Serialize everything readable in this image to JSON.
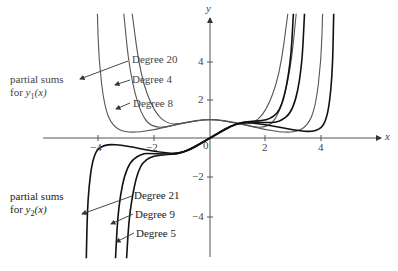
{
  "chart_data": {
    "type": "line",
    "title": "",
    "xlabel": "x",
    "ylabel": "y",
    "xlim": [
      -6,
      6.2
    ],
    "ylim": [
      -6.2,
      6.5
    ],
    "grid": false,
    "x_ticks": [
      -4,
      -2,
      0,
      2,
      4
    ],
    "y_ticks": [
      -4,
      -2,
      2,
      4
    ],
    "x_tick_labels": [
      "-4",
      "-2",
      "0",
      "2",
      "4"
    ],
    "y_tick_labels": [
      "-4",
      "-2",
      "2",
      "4"
    ],
    "groups": [
      {
        "label": "partial sums for y1(x)",
        "series": [
          {
            "name": "Degree 20",
            "color": "#555555",
            "points": [
              [
                -4.05,
                6.4
              ],
              [
                -4.0,
                4.0
              ],
              [
                -3.8,
                1.6
              ],
              [
                -3.5,
                0.6
              ],
              [
                -3.0,
                0.25
              ],
              [
                -2.0,
                0.4
              ],
              [
                -1.0,
                0.8
              ],
              [
                0,
                1.0
              ],
              [
                1.0,
                0.8
              ],
              [
                2.0,
                0.4
              ],
              [
                3.0,
                0.25
              ],
              [
                3.5,
                0.6
              ],
              [
                3.8,
                1.6
              ],
              [
                4.0,
                4.0
              ],
              [
                4.05,
                6.4
              ]
            ]
          },
          {
            "name": "Degree 4",
            "color": "#555555",
            "points": [
              [
                -2.8,
                6.4
              ],
              [
                -2.5,
                3.2
              ],
              [
                -2.0,
                1.3
              ],
              [
                -1.5,
                0.7
              ],
              [
                -1.0,
                0.75
              ],
              [
                0,
                1.0
              ],
              [
                1.0,
                0.75
              ],
              [
                1.5,
                0.7
              ],
              [
                2.0,
                1.3
              ],
              [
                2.5,
                3.2
              ],
              [
                2.8,
                6.4
              ]
            ]
          },
          {
            "name": "Degree 8",
            "color": "#555555",
            "points": [
              [
                -3.1,
                6.4
              ],
              [
                -2.9,
                3.5
              ],
              [
                -2.5,
                1.2
              ],
              [
                -2.0,
                0.45
              ],
              [
                -1.0,
                0.75
              ],
              [
                0,
                1.0
              ],
              [
                1.0,
                0.75
              ],
              [
                2.0,
                0.45
              ],
              [
                2.5,
                1.2
              ],
              [
                2.9,
                3.5
              ],
              [
                3.1,
                6.4
              ]
            ]
          }
        ]
      },
      {
        "label": "partial sums for y2(x)",
        "series": [
          {
            "name": "Degree 21",
            "color": "#111111",
            "points": [
              [
                -4.45,
                -6.2
              ],
              [
                -4.4,
                -3.0
              ],
              [
                -4.2,
                -0.8
              ],
              [
                -3.8,
                -0.3
              ],
              [
                -3.0,
                -0.4
              ],
              [
                -2.0,
                -0.7
              ],
              [
                -1.0,
                -0.85
              ],
              [
                0,
                0
              ],
              [
                1.0,
                0.85
              ],
              [
                2.0,
                0.7
              ],
              [
                3.0,
                0.4
              ],
              [
                3.8,
                0.3
              ],
              [
                4.2,
                0.8
              ],
              [
                4.4,
                3.0
              ],
              [
                4.45,
                6.4
              ]
            ]
          },
          {
            "name": "Degree 9",
            "color": "#111111",
            "points": [
              [
                -3.4,
                -6.2
              ],
              [
                -3.3,
                -3.5
              ],
              [
                -3.0,
                -1.4
              ],
              [
                -2.5,
                -0.8
              ],
              [
                -2.0,
                -0.8
              ],
              [
                -1.0,
                -0.85
              ],
              [
                0,
                0
              ],
              [
                1.0,
                0.85
              ],
              [
                2.0,
                0.8
              ],
              [
                2.5,
                0.8
              ],
              [
                3.0,
                1.4
              ],
              [
                3.3,
                3.5
              ],
              [
                3.4,
                6.4
              ]
            ]
          },
          {
            "name": "Degree 5",
            "color": "#111111",
            "points": [
              [
                -3.0,
                -6.2
              ],
              [
                -2.9,
                -3.8
              ],
              [
                -2.6,
                -1.6
              ],
              [
                -2.2,
                -0.95
              ],
              [
                -1.5,
                -0.85
              ],
              [
                -1.0,
                -0.8
              ],
              [
                0,
                0
              ],
              [
                1.0,
                0.8
              ],
              [
                1.5,
                0.85
              ],
              [
                2.2,
                0.95
              ],
              [
                2.6,
                1.6
              ],
              [
                2.9,
                3.8
              ],
              [
                3.0,
                6.4
              ]
            ]
          }
        ]
      }
    ]
  },
  "labels": {
    "y1_group_line1": "partial sums",
    "y1_group_line2_prefix": "for ",
    "y1_group_fn": "y",
    "y1_group_sub": "1",
    "y1_group_arg": "(x)",
    "y2_group_line1": "partial sums",
    "y2_group_line2_prefix": "for ",
    "y2_group_fn": "y",
    "y2_group_sub": "2",
    "y2_group_arg": "(x)",
    "deg20": "Degree 20",
    "deg4": "Degree 4",
    "deg8": "Degree 8",
    "deg21": "Degree 21",
    "deg9": "Degree 9",
    "deg5": "Degree 5",
    "x_axis": "x",
    "y_axis": "y"
  },
  "ticks": {
    "xm4": "−4",
    "xm2": "−2",
    "x0": "0",
    "x2": "2",
    "x4": "4",
    "y4": "4",
    "y2": "2",
    "ym2": "−2",
    "ym4": "−4"
  }
}
